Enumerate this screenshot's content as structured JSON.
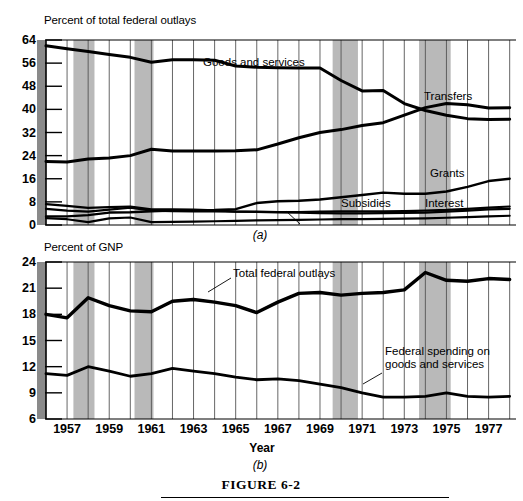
{
  "figure": {
    "caption": "FIGURE 6-2",
    "panel_a_letter": "(a)",
    "panel_b_letter": "(b)",
    "x_axis_label": "Year"
  },
  "panel_a": {
    "y_axis_title": "Percent of total federal outlays",
    "yticks": [
      "64",
      "56",
      "48",
      "40",
      "32",
      "24",
      "16",
      "8",
      "0"
    ],
    "labels": {
      "goods": "Goods and services",
      "transfers": "Transfers",
      "grants": "Grants",
      "subsidies": "Subsidies",
      "interest": "Interest"
    }
  },
  "panel_b": {
    "y_axis_title": "Percent of GNP",
    "yticks": [
      "24",
      "21",
      "18",
      "15",
      "12",
      "9",
      "6"
    ],
    "labels": {
      "total": "Total federal outlays",
      "goods": "Federal spending on goods and services"
    }
  },
  "xticks": [
    "1957",
    "1959",
    "1961",
    "1963",
    "1965",
    "1967",
    "1969",
    "1971",
    "1973",
    "1975",
    "1977"
  ],
  "colors": {
    "line": "#000000",
    "grid": "#555555",
    "recession_band": "#b9b9b9",
    "axis_band": "#8a8a8a",
    "background": "#ffffff"
  },
  "chart_data": {
    "type": "line",
    "title": "FIGURE 6-2",
    "xlabel": "Year",
    "grid": true,
    "legend": "inline-annotations",
    "x": [
      1956,
      1957,
      1958,
      1959,
      1960,
      1961,
      1962,
      1963,
      1964,
      1965,
      1966,
      1967,
      1968,
      1969,
      1970,
      1971,
      1972,
      1973,
      1974,
      1975,
      1976,
      1977,
      1978
    ],
    "recession_bands": [
      [
        1957.3,
        1958.3
      ],
      [
        1960.2,
        1961.1
      ],
      [
        1969.6,
        1970.8
      ],
      [
        1973.7,
        1975.2
      ]
    ],
    "panels": [
      {
        "name": "(a)",
        "ylabel": "Percent of total federal outlays",
        "ylim": [
          0,
          64
        ],
        "yticks": [
          0,
          8,
          16,
          24,
          32,
          40,
          48,
          56,
          64
        ],
        "series": [
          {
            "name": "Goods and services",
            "values": [
              62.0,
              61.0,
              60.0,
              59.0,
              58.0,
              56.3,
              57.2,
              57.2,
              57.0,
              55.0,
              54.6,
              54.4,
              54.3,
              54.3,
              50.0,
              46.4,
              46.5,
              42.0,
              39.6,
              38.0,
              36.8,
              36.5,
              36.6
            ]
          },
          {
            "name": "Transfers",
            "values": [
              22.0,
              21.8,
              22.8,
              23.2,
              24.0,
              26.2,
              25.6,
              25.6,
              25.6,
              25.7,
              26.0,
              28.0,
              30.2,
              32.0,
              33.0,
              34.4,
              35.4,
              38.0,
              40.6,
              42.0,
              41.6,
              40.5,
              40.6
            ]
          },
          {
            "name": "Grants",
            "values": [
              3.0,
              3.0,
              3.4,
              4.3,
              4.4,
              4.7,
              5.0,
              5.1,
              5.2,
              5.5,
              7.6,
              8.2,
              8.4,
              8.8,
              9.6,
              10.4,
              11.2,
              10.8,
              10.8,
              11.6,
              13.2,
              15.2,
              16.0,
              16.2
            ]
          },
          {
            "name": "Subsidies",
            "values": [
              7.2,
              6.6,
              5.9,
              6.2,
              6.4,
              5.4,
              5.4,
              5.3,
              5.1,
              4.6,
              4.5,
              4.4,
              4.3,
              4.1,
              4.0,
              4.0,
              4.1,
              4.2,
              4.3,
              4.6,
              5.0,
              5.4,
              5.6
            ]
          },
          {
            "name": "Interest",
            "values": [
              5.6,
              5.0,
              4.6,
              5.3,
              6.0,
              5.0,
              4.8,
              4.7,
              4.7,
              4.6,
              4.6,
              4.5,
              4.5,
              4.6,
              4.7,
              4.7,
              4.7,
              4.8,
              5.0,
              5.2,
              5.6,
              6.0,
              6.4
            ]
          },
          {
            "name": "Net interest (lowest)",
            "values": [
              2.4,
              2.0,
              1.0,
              2.3,
              2.6,
              1.0,
              1.1,
              1.2,
              1.3,
              1.4,
              1.6,
              1.7,
              1.8,
              1.9,
              2.0,
              2.0,
              2.1,
              2.2,
              2.3,
              2.5,
              2.7,
              3.0,
              3.2
            ]
          }
        ]
      },
      {
        "name": "(b)",
        "ylabel": "Percent of GNP",
        "ylim": [
          6,
          24
        ],
        "yticks": [
          6,
          9,
          12,
          15,
          18,
          21,
          24
        ],
        "series": [
          {
            "name": "Total federal outlays",
            "values": [
              18.0,
              17.6,
              19.9,
              19.0,
              18.4,
              18.3,
              19.5,
              19.7,
              19.4,
              19.0,
              18.2,
              19.4,
              20.4,
              20.5,
              20.2,
              20.4,
              20.5,
              20.8,
              22.8,
              21.9,
              21.8,
              22.1,
              22.0
            ]
          },
          {
            "name": "Federal spending on goods and services",
            "values": [
              11.2,
              11.0,
              12.0,
              11.5,
              10.9,
              11.2,
              11.8,
              11.5,
              11.2,
              10.8,
              10.5,
              10.6,
              10.4,
              10.0,
              9.6,
              9.0,
              8.5,
              8.5,
              8.6,
              9.0,
              8.6,
              8.5,
              8.6
            ]
          }
        ]
      }
    ]
  }
}
